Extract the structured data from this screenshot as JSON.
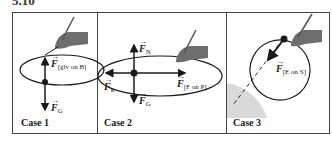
{
  "figure": {
    "number": "5.10"
  },
  "panels": [
    {
      "case_label": "Case 1",
      "forces": [
        {
          "symbol": "F",
          "subscript": "[glv on B]",
          "direction": "up"
        },
        {
          "symbol": "F",
          "subscript": "G",
          "direction": "down"
        }
      ]
    },
    {
      "case_label": "Case 2",
      "forces": [
        {
          "symbol": "F",
          "subscript": "N",
          "direction": "up"
        },
        {
          "symbol": "F",
          "subscript": "k",
          "direction": "left"
        },
        {
          "symbol": "F",
          "subscript": "[F on P]",
          "direction": "right"
        },
        {
          "symbol": "F",
          "subscript": "G",
          "direction": "down"
        }
      ]
    },
    {
      "case_label": "Case 3",
      "forces": [
        {
          "symbol": "F",
          "subscript": "[E on S]",
          "direction": "down-left"
        }
      ]
    }
  ],
  "colors": {
    "line": "#1a1a1a",
    "hand": "#6e6e6e",
    "earth": "#d9d9d9"
  }
}
